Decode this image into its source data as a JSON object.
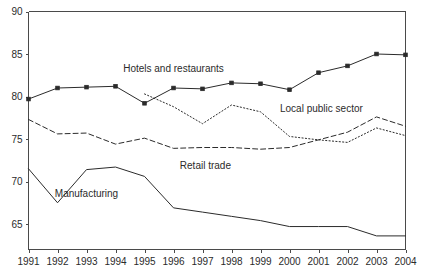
{
  "chart_data": {
    "type": "line",
    "title": "",
    "xlabel": "",
    "ylabel": "",
    "x": [
      1991,
      1992,
      1993,
      1994,
      1995,
      1996,
      1997,
      1998,
      1999,
      2000,
      2001,
      2002,
      2003,
      2004
    ],
    "xtick_labels": [
      "1991",
      "1992",
      "1993",
      "1994",
      "1995",
      "1996",
      "1997",
      "1998",
      "1999",
      "2000",
      "2001",
      "2002",
      "2003",
      "2004"
    ],
    "ytick_labels": [
      "90",
      "85",
      "80",
      "75",
      "70",
      "65"
    ],
    "yticks": [
      90,
      85,
      80,
      75,
      70,
      65
    ],
    "ylim": [
      62.0,
      90.0
    ],
    "xlim": [
      1991,
      2004
    ],
    "grid": false,
    "legend_position": "inline-annotations",
    "series": [
      {
        "name": "Hotels and restaurants",
        "style": "solid",
        "markers": "square",
        "x": [
          1991,
          1992,
          1993,
          1994,
          1995,
          1996,
          1997,
          1998,
          1999,
          2000,
          2001,
          2002,
          2003,
          2004
        ],
        "values": [
          79.7,
          81.0,
          81.1,
          81.2,
          79.2,
          81.0,
          80.9,
          81.6,
          81.5,
          80.8,
          82.8,
          83.6,
          85.0,
          84.9
        ],
        "label_x": 1996.0,
        "label_y": 82.9
      },
      {
        "name": "Local public sector",
        "style": "dotted",
        "markers": "none",
        "x": [
          1995,
          1996,
          1997,
          1998,
          1999,
          2000,
          2001,
          2002,
          2003,
          2004
        ],
        "values": [
          80.3,
          78.8,
          76.8,
          79.0,
          78.2,
          75.3,
          74.9,
          74.6,
          76.3,
          75.4
        ],
        "label_x": 2001.1,
        "label_y": 78.2
      },
      {
        "name": "Retail trade",
        "style": "dashed",
        "markers": "none",
        "x": [
          1991,
          1992,
          1993,
          1994,
          1995,
          1996,
          1997,
          1998,
          1999,
          2000,
          2001,
          2002,
          2003,
          2004
        ],
        "values": [
          77.3,
          75.6,
          75.7,
          74.4,
          75.1,
          73.9,
          74.0,
          74.0,
          73.8,
          74.0,
          74.9,
          75.8,
          77.6,
          76.5
        ],
        "label_x": 1997.1,
        "label_y": 71.5
      },
      {
        "name": "Manufacturing",
        "style": "solid",
        "markers": "none",
        "x": [
          1991,
          1992,
          1993,
          1994,
          1995,
          1996,
          1997,
          1998,
          1999,
          2000,
          2001,
          2002,
          2003,
          2004
        ],
        "values": [
          71.5,
          67.5,
          71.4,
          71.7,
          70.6,
          66.9,
          66.4,
          65.9,
          65.4,
          64.7,
          64.7,
          64.7,
          63.6,
          63.6
        ],
        "label_x": 1993.0,
        "label_y": 68.2
      }
    ]
  },
  "colors": {
    "ink": "#2b2b2b",
    "axis": "#4a4a4a",
    "background": "#ffffff"
  }
}
